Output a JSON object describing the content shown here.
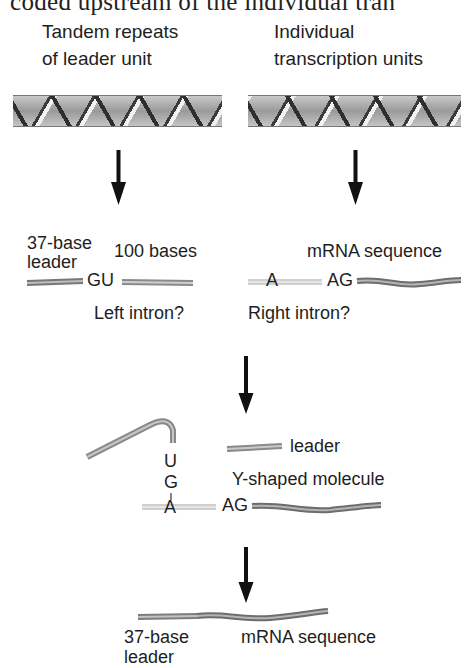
{
  "header": {
    "cropped_text": "coded upstream of the individual tran"
  },
  "panel_top": {
    "left_title_line1": "Tandem repeats",
    "left_title_line2": "of leader unit",
    "right_title_line1": "Individual",
    "right_title_line2": "transcription units"
  },
  "step1": {
    "leader_line1": "37-base",
    "leader_line2": "leader",
    "bases_label": "100 bases",
    "gu_label": "GU",
    "left_intron_label": "Left intron?",
    "mrna_label": "mRNA sequence",
    "a_label": "A",
    "ag_label": "AG",
    "right_intron_label": "Right intron?"
  },
  "step2": {
    "leader_label": "leader",
    "y_label": "Y-shaped molecule",
    "u_label": "U",
    "g_label": "G",
    "a_label": "A",
    "ag_label": "AG"
  },
  "step3": {
    "leader_line1": "37-base",
    "leader_line2": "leader",
    "mrna_label": "mRNA sequence"
  },
  "colors": {
    "rna_dark": "#7a7a7a",
    "rna_light": "#cfcfcf",
    "intron": "#d6d6d6",
    "arrow": "#111111"
  }
}
